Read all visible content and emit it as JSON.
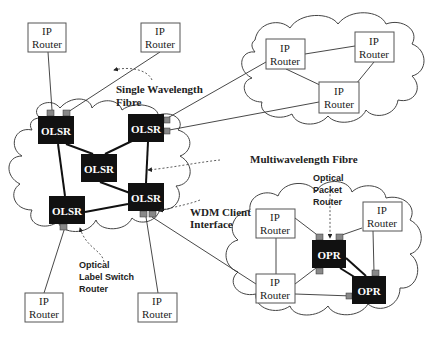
{
  "colors": {
    "node_fill": "#111111",
    "port_fill": "#888888",
    "line": "#222222",
    "cloud": "#444444",
    "box_border": "#555555"
  },
  "nodes": {
    "olsr": [
      {
        "id": "olsr-1",
        "label": "OLSR",
        "x": 38,
        "y": 116,
        "w": 36,
        "h": 28
      },
      {
        "id": "olsr-2",
        "label": "OLSR",
        "x": 128,
        "y": 114,
        "w": 36,
        "h": 28
      },
      {
        "id": "olsr-3",
        "label": "OLSR",
        "x": 81,
        "y": 154,
        "w": 36,
        "h": 28
      },
      {
        "id": "olsr-4",
        "label": "OLSR",
        "x": 128,
        "y": 183,
        "w": 36,
        "h": 28
      },
      {
        "id": "olsr-5",
        "label": "OLSR",
        "x": 49,
        "y": 196,
        "w": 36,
        "h": 28
      }
    ],
    "opr": [
      {
        "id": "opr-1",
        "label": "OPR",
        "x": 312,
        "y": 240,
        "w": 34,
        "h": 28
      },
      {
        "id": "opr-2",
        "label": "OPR",
        "x": 352,
        "y": 276,
        "w": 34,
        "h": 28
      }
    ],
    "ip_routers": [
      {
        "id": "ip-top-left",
        "line1": "IP",
        "line2": "Router",
        "x": 28,
        "y": 23,
        "w": 38,
        "h": 29
      },
      {
        "id": "ip-top-mid",
        "line1": "IP",
        "line2": "Router",
        "x": 141,
        "y": 23,
        "w": 39,
        "h": 29
      },
      {
        "id": "ip-cloud-right-a",
        "line1": "IP",
        "line2": "Router",
        "x": 266,
        "y": 39,
        "w": 39,
        "h": 30
      },
      {
        "id": "ip-cloud-right-b",
        "line1": "IP",
        "line2": "Router",
        "x": 355,
        "y": 32,
        "w": 39,
        "h": 30
      },
      {
        "id": "ip-cloud-right-c",
        "line1": "IP",
        "line2": "Router",
        "x": 319,
        "y": 82,
        "w": 40,
        "h": 31
      },
      {
        "id": "ip-bottom-left",
        "line1": "IP",
        "line2": "Router",
        "x": 25,
        "y": 293,
        "w": 38,
        "h": 29
      },
      {
        "id": "ip-bottom-mid",
        "line1": "IP",
        "line2": "Router",
        "x": 138,
        "y": 293,
        "w": 39,
        "h": 29
      },
      {
        "id": "ip-opr-a",
        "line1": "IP",
        "line2": "Router",
        "x": 256,
        "y": 209,
        "w": 39,
        "h": 29
      },
      {
        "id": "ip-opr-b",
        "line1": "IP",
        "line2": "Router",
        "x": 363,
        "y": 202,
        "w": 39,
        "h": 29
      },
      {
        "id": "ip-opr-c",
        "line1": "IP",
        "line2": "Router",
        "x": 256,
        "y": 274,
        "w": 39,
        "h": 29
      }
    ]
  },
  "labels": {
    "single_wavelength_line1": "Single Wavelength",
    "single_wavelength_line2": "Fibre",
    "multiwavelength": "Multiwavelength Fibre",
    "wdm_line1": "WDM Client",
    "wdm_line2": "Interface",
    "olsr_caption_line1": "Optical",
    "olsr_caption_line2": "Label Switch",
    "olsr_caption_line3": "Router",
    "opr_caption_line1": "Optical",
    "opr_caption_line2": "Packet",
    "opr_caption_line3": "Router"
  }
}
